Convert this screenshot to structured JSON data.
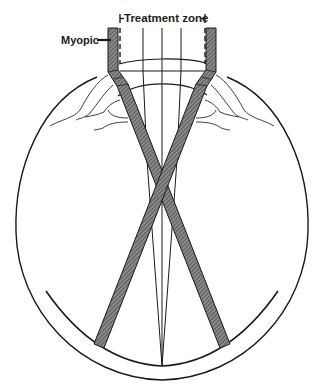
{
  "diagram": {
    "labels": {
      "treatment_zone": "Treatment zone",
      "myopic": "Myopic"
    },
    "colors": {
      "line": "#1a1a1a",
      "beam_fill": "#6b6b6b",
      "background": "#ffffff"
    },
    "elements": [
      "eye-globe-outline",
      "retina-arc",
      "cornea-arcs",
      "lens-arc",
      "iris-ciliary-left",
      "iris-ciliary-right",
      "treatment-zone-dashed-bounds",
      "left-myopic-beam",
      "right-myopic-beam",
      "central-rays"
    ]
  }
}
